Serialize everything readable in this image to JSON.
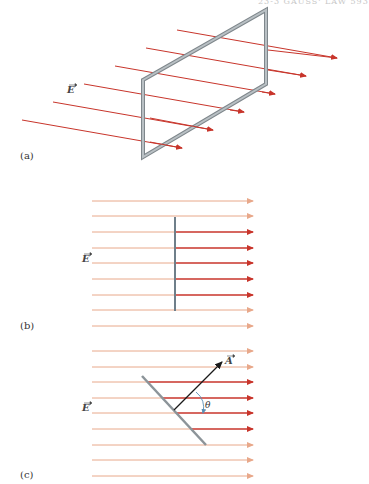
{
  "page_header": "23-3 GAUSS' LAW 593",
  "colors": {
    "field_arrow_strong": "#c8352b",
    "field_arrow_faint": "#e8a88a",
    "loop_gray": "#9aa3a8",
    "area_vector": "#1a1a1a",
    "angle_arc": "#5a8fb5"
  },
  "panels": [
    {
      "id": "a",
      "label": "(a)",
      "field_label": "E",
      "description": "Rectangular loop in uniform electric field, perspective view"
    },
    {
      "id": "b",
      "label": "(b)",
      "field_label": "E",
      "description": "Loop edge-on, perpendicular to field lines"
    },
    {
      "id": "c",
      "label": "(c)",
      "field_label": "E",
      "area_label": "A",
      "angle_label": "θ",
      "description": "Loop tilted at angle θ to field"
    }
  ]
}
